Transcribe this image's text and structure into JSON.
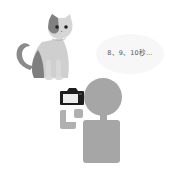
{
  "scene": {
    "speech_bubble": {
      "text": "8、9、10秒…"
    },
    "icons": {
      "cat": "cat-illustration",
      "camera": "camera-icon",
      "person": "person-silhouette"
    },
    "colors": {
      "person_fill": "#a6a6a6",
      "camera_frame": "#1e1e1e",
      "camera_screen": "#eeeeee",
      "bubble_fill": "#f7f7f7",
      "cat_light": "#c9c9c9",
      "cat_dark": "#7a7a7a"
    }
  }
}
